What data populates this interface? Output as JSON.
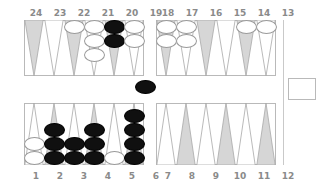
{
  "board": {
    "title": "Backgammon Board",
    "colors": {
      "background": "#ffffff",
      "frame_line": "#b9b9b9",
      "triangle_shaded_fill": "#d6d6d6",
      "triangle_light_fill": "#ffffff",
      "triangle_outline": "#a8a8a8",
      "label_text": "#8a8a8a",
      "checker_white_fill": "#ffffff",
      "checker_white_border": "#9a9a9a",
      "checker_black_fill": "#101010",
      "checker_black_border": "#000000"
    },
    "top_labels": [
      "24",
      "23",
      "22",
      "21",
      "20",
      "19",
      "18",
      "17",
      "16",
      "15",
      "14",
      "13"
    ],
    "bottom_labels": [
      "1",
      "2",
      "3",
      "4",
      "5",
      "6",
      "7",
      "8",
      "9",
      "10",
      "11",
      "12"
    ],
    "top_points": [
      {
        "label": "24",
        "shade": "dark",
        "checkers": 0,
        "color": "none"
      },
      {
        "label": "23",
        "shade": "light",
        "checkers": 0,
        "color": "none"
      },
      {
        "label": "22",
        "shade": "dark",
        "checkers": 1,
        "color": "white"
      },
      {
        "label": "21",
        "shade": "light",
        "checkers": 3,
        "color": "white"
      },
      {
        "label": "20",
        "shade": "dark",
        "checkers": 2,
        "color": "black"
      },
      {
        "label": "19",
        "shade": "light",
        "checkers": 2,
        "color": "white"
      },
      {
        "label": "18",
        "shade": "dark",
        "checkers": 2,
        "color": "white"
      },
      {
        "label": "17",
        "shade": "light",
        "checkers": 2,
        "color": "white"
      },
      {
        "label": "16",
        "shade": "dark",
        "checkers": 0,
        "color": "none"
      },
      {
        "label": "15",
        "shade": "light",
        "checkers": 0,
        "color": "none"
      },
      {
        "label": "14",
        "shade": "dark",
        "checkers": 1,
        "color": "white"
      },
      {
        "label": "13",
        "shade": "light",
        "checkers": 1,
        "color": "white"
      }
    ],
    "bottom_points": [
      {
        "label": "1",
        "shade": "light",
        "checkers": 2,
        "color": "white"
      },
      {
        "label": "2",
        "shade": "dark",
        "checkers": 3,
        "color": "black"
      },
      {
        "label": "3",
        "shade": "light",
        "checkers": 2,
        "color": "black"
      },
      {
        "label": "4",
        "shade": "dark",
        "checkers": 3,
        "color": "black"
      },
      {
        "label": "5",
        "shade": "light",
        "checkers": 1,
        "color": "white"
      },
      {
        "label": "6",
        "shade": "dark",
        "checkers": 4,
        "color": "black"
      },
      {
        "label": "7",
        "shade": "light",
        "checkers": 0,
        "color": "none"
      },
      {
        "label": "8",
        "shade": "dark",
        "checkers": 0,
        "color": "none"
      },
      {
        "label": "9",
        "shade": "light",
        "checkers": 0,
        "color": "none"
      },
      {
        "label": "10",
        "shade": "dark",
        "checkers": 0,
        "color": "none"
      },
      {
        "label": "11",
        "shade": "light",
        "checkers": 0,
        "color": "none"
      },
      {
        "label": "12",
        "shade": "dark",
        "checkers": 0,
        "color": "none"
      }
    ],
    "bar": {
      "checkers": 1,
      "color": "black"
    },
    "side_tray": {
      "label": "",
      "contents": ""
    }
  }
}
